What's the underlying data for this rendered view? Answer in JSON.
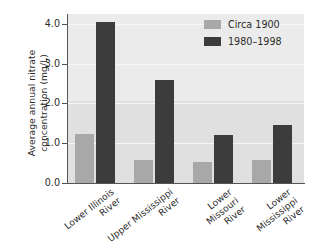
{
  "chart_data": {
    "type": "bar",
    "title": "",
    "xlabel": "",
    "ylabel": "Average annual nitrate\nconcentration (mg/L)",
    "ylim": [
      0.0,
      4.25
    ],
    "yticks": [
      "0.0",
      "1.0",
      "2.0",
      "3.0",
      "4.0"
    ],
    "ytick_values": [
      0.0,
      1.0,
      2.0,
      3.0,
      4.0
    ],
    "grid": true,
    "legend_position": "top-right",
    "categories": [
      "Lower Illinois\nRiver",
      "Upper Mississippi\nRiver",
      "Lower\nMissouri\nRiver",
      "Lower\nMississippi\nRiver"
    ],
    "series": [
      {
        "name": "Circa 1900",
        "color": "#a8a8a8",
        "values": [
          1.23,
          0.58,
          0.52,
          0.57
        ]
      },
      {
        "name": "1980–1998",
        "color": "#3c3c3c",
        "values": [
          4.05,
          2.6,
          1.22,
          1.45
        ]
      }
    ]
  },
  "legend": {
    "items": [
      {
        "label": "Circa 1900",
        "swatch": "light"
      },
      {
        "label": "1980–1998",
        "swatch": "dark"
      }
    ]
  },
  "colors": {
    "series_light": "#a8a8a8",
    "series_dark": "#3c3c3c",
    "plot_background": "#ebebeb",
    "plot_band": "#e0e0e0",
    "gridline": "#f6f6f6",
    "axis": "#555555",
    "text": "#2b2b2b"
  }
}
